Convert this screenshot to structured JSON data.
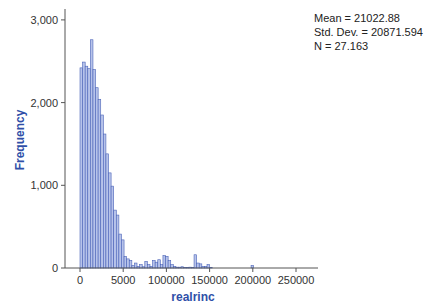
{
  "chart_data": {
    "type": "bar",
    "title": "",
    "xlabel": "realrinc",
    "ylabel": "Frequency",
    "xlim": [
      -15000,
      275000
    ],
    "ylim": [
      0,
      3100
    ],
    "x_ticks": [
      0,
      50000,
      100000,
      150000,
      200000,
      250000
    ],
    "x_tick_labels": [
      "0",
      "5000",
      "100000",
      "150000",
      "200000",
      "250000"
    ],
    "y_ticks": [
      0,
      1000,
      2000,
      3000
    ],
    "y_tick_labels": [
      "0",
      "1,000",
      "2,000",
      "3,000"
    ],
    "grid": false,
    "bin_width": 3000,
    "bin_start": 0,
    "values": [
      2420,
      2490,
      2440,
      2410,
      2760,
      2400,
      2180,
      2040,
      1850,
      1620,
      1380,
      1150,
      990,
      700,
      640,
      410,
      340,
      140,
      110,
      90,
      30,
      60,
      20,
      40,
      15,
      80,
      40,
      20,
      90,
      70,
      100,
      40,
      150,
      140,
      90,
      40,
      20,
      10,
      10,
      15,
      5,
      5,
      10,
      5,
      160,
      60,
      50,
      20,
      20,
      40,
      5,
      0,
      0,
      0,
      0,
      0,
      0,
      0,
      0,
      0,
      0,
      0,
      0,
      0,
      0,
      0,
      30,
      0,
      0,
      0,
      0,
      0,
      0,
      0,
      0,
      0,
      0,
      0,
      0,
      0
    ],
    "stats": {
      "mean": "Mean = 21022.88",
      "std_dev": "Std. Dev. = 20871.594",
      "n": "N = 27.163"
    },
    "colors": {
      "bar_fill": "#b7c3ea",
      "bar_stroke": "#4a63b8",
      "axis_label": "#2f4fa8",
      "axis": "#555555"
    }
  }
}
